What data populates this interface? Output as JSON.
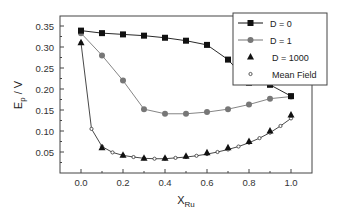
{
  "chart_data": {
    "type": "line",
    "title": "",
    "xlabel": "X",
    "xlabel_sub": "Ru",
    "ylabel": "E",
    "ylabel_sub": "p",
    "ylabel_suffix": " / V",
    "xlim": [
      -0.1,
      1.1
    ],
    "ylim": [
      0.0,
      0.37
    ],
    "xticks": [
      0.0,
      0.2,
      0.4,
      0.6,
      0.8,
      1.0
    ],
    "xtick_labels": [
      "0.0",
      "0.2",
      "0.4",
      "0.6",
      "0.8",
      "1.0"
    ],
    "yticks": [
      0.05,
      0.1,
      0.15,
      0.2,
      0.25,
      0.3,
      0.35
    ],
    "ytick_labels": [
      "0.05",
      "0.10",
      "0.15",
      "0.20",
      "0.25",
      "0.30",
      "0.35"
    ],
    "grid": false,
    "legend_position": "top-right",
    "series": [
      {
        "name": "D = 0",
        "marker": "square",
        "color": "#111111",
        "line": true,
        "x": [
          0.0,
          0.1,
          0.2,
          0.3,
          0.4,
          0.5,
          0.6,
          0.7,
          0.8,
          0.9,
          1.0
        ],
        "y": [
          0.339,
          0.333,
          0.33,
          0.327,
          0.322,
          0.315,
          0.305,
          0.27,
          0.215,
          0.21,
          0.183
        ]
      },
      {
        "name": "D = 1",
        "marker": "circle",
        "color": "#777777",
        "line": true,
        "x": [
          0.0,
          0.1,
          0.2,
          0.3,
          0.4,
          0.5,
          0.6,
          0.7,
          0.8,
          0.9,
          1.0
        ],
        "y": [
          0.333,
          0.28,
          0.22,
          0.152,
          0.141,
          0.141,
          0.145,
          0.152,
          0.163,
          0.177,
          0.182
        ]
      },
      {
        "name": "D = 1000",
        "marker": "triangle",
        "color": "#111111",
        "line": false,
        "x": [
          0.0,
          0.1,
          0.2,
          0.3,
          0.4,
          0.5,
          0.6,
          0.7,
          0.8,
          0.9,
          1.0
        ],
        "y": [
          0.31,
          0.06,
          0.042,
          0.035,
          0.035,
          0.04,
          0.048,
          0.06,
          0.075,
          0.1,
          0.138
        ]
      },
      {
        "name": "Mean Field",
        "marker": "open-circle",
        "color": "#333333",
        "line": true,
        "x": [
          0.0,
          0.05,
          0.1,
          0.15,
          0.2,
          0.25,
          0.3,
          0.35,
          0.4,
          0.45,
          0.5,
          0.55,
          0.6,
          0.65,
          0.7,
          0.75,
          0.8,
          0.85,
          0.9,
          0.95,
          1.0
        ],
        "y": [
          0.31,
          0.105,
          0.063,
          0.049,
          0.042,
          0.038,
          0.035,
          0.034,
          0.034,
          0.036,
          0.038,
          0.041,
          0.045,
          0.05,
          0.056,
          0.063,
          0.072,
          0.083,
          0.096,
          0.112,
          0.13
        ]
      }
    ]
  }
}
